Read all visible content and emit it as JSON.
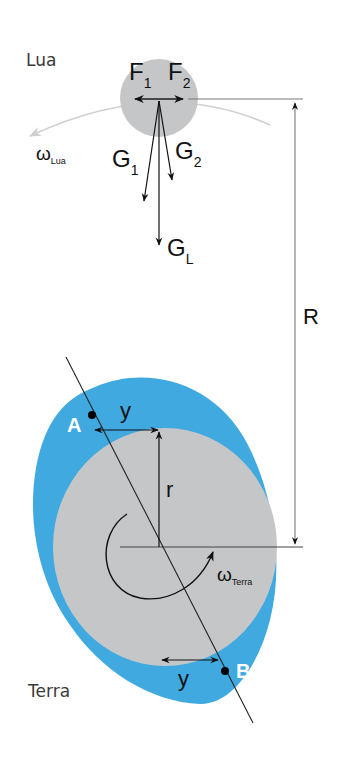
{
  "moon": {
    "label": "Lua",
    "force_labels": {
      "f1": "F",
      "f1_sub": "1",
      "f2": "F",
      "f2_sub": "2",
      "g1": "G",
      "g1_sub": "1",
      "g2": "G",
      "g2_sub": "2",
      "gl": "G",
      "gl_sub": "L"
    },
    "angular_velocity": {
      "symbol": "ω",
      "sub": "Lua"
    }
  },
  "earth": {
    "label": "Terra",
    "radius_label": "r",
    "point_a": "A",
    "point_b": "B",
    "bulge_label_top": "y",
    "bulge_label_bottom": "y",
    "angular_velocity": {
      "symbol": "ω",
      "sub": "Terra"
    }
  },
  "distance_label": "R",
  "colors": {
    "ocean": "#3fa9e0",
    "body": "#c4c6c8",
    "arrow": "#111111",
    "orbit": "#cfcfcf"
  }
}
